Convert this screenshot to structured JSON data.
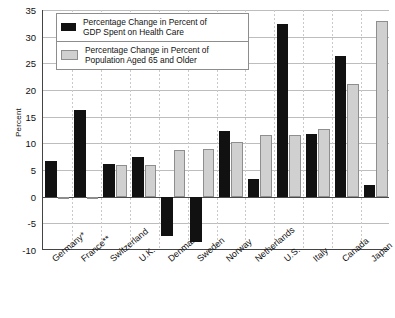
{
  "chart_data": {
    "type": "bar",
    "title": "",
    "xlabel": "",
    "ylabel": "Percent",
    "ylim": [
      -10,
      35
    ],
    "ytick_step": 5,
    "yticks": [
      "35",
      "30",
      "25",
      "20",
      "15",
      "10",
      "5",
      "0",
      "-5",
      "-10"
    ],
    "grid": true,
    "legend_position": "top-left",
    "categories": [
      "Germany*",
      "France**",
      "Switzerland",
      "U.K.",
      "Denmark",
      "Sweden",
      "Norway",
      "Netherlands",
      "U.S.",
      "Italy",
      "Canada",
      "Japan"
    ],
    "series": [
      {
        "name": "Percentage Change in Percent of GDP Spent on Health Care",
        "color": "#111111",
        "values": [
          6.6,
          16.2,
          6.2,
          7.4,
          -7.3,
          -8.5,
          12.3,
          3.3,
          32.3,
          11.8,
          26.3,
          2.1
        ]
      },
      {
        "name": "Percentage Change in Percent of Population Aged 65 and Older",
        "color": "#d0d0d0",
        "values": [
          -0.5,
          0.0,
          6.0,
          6.0,
          8.7,
          9.0,
          10.3,
          11.5,
          11.6,
          12.6,
          21.2,
          33.0
        ]
      }
    ]
  },
  "legend": {
    "items": [
      {
        "swatch": "dark",
        "line1": "Percentage Change in Percent of",
        "line2": "GDP Spent on Health Care"
      },
      {
        "swatch": "light",
        "line1": "Percentage Change in Percent of",
        "line2": "Population Aged 65 and Older"
      }
    ]
  },
  "axis": {
    "y_title": "Percent"
  }
}
